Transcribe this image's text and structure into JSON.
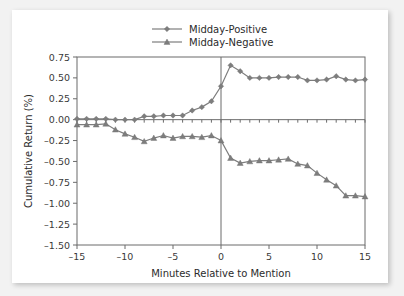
{
  "figure": {
    "background_color": "#f2f2f2",
    "card_color": "#ffffff",
    "line_color": "#7d7d7d",
    "axis_color": "#6b6b6b"
  },
  "chart_data": {
    "type": "line",
    "title": "",
    "xlabel": "Minutes Relative to Mention",
    "ylabel": "Cumulative Return (%)",
    "xlim": [
      -15,
      15
    ],
    "ylim": [
      -1.5,
      0.75
    ],
    "xticks": [
      -15,
      -10,
      -5,
      0,
      5,
      10,
      15
    ],
    "xtick_labels": [
      "–15",
      "–10",
      "–5",
      "0",
      "5",
      "10",
      "15"
    ],
    "yticks": [
      0.75,
      0.5,
      0.25,
      0,
      -0.25,
      -0.5,
      -0.75,
      -1.0,
      -1.25,
      -1.5
    ],
    "ytick_labels": [
      "0.75",
      "0.50",
      "0.25",
      "0.00",
      "–0.25",
      "–0.50",
      "–0.75",
      "–1.00",
      "–1.25",
      "–1.50"
    ],
    "grid": false,
    "legend_position": "top-center",
    "reference_lines": [
      {
        "axis": "x",
        "value": 0
      },
      {
        "axis": "y",
        "value": 0
      }
    ],
    "x": [
      -15,
      -14,
      -13,
      -12,
      -11,
      -10,
      -9,
      -8,
      -7,
      -6,
      -5,
      -4,
      -3,
      -2,
      -1,
      0,
      1,
      2,
      3,
      4,
      5,
      6,
      7,
      8,
      9,
      10,
      11,
      12,
      13,
      14,
      15
    ],
    "series": [
      {
        "name": "Midday-Positive",
        "marker": "diamond",
        "color": "#7d7d7d",
        "values": [
          0.01,
          0.01,
          0.01,
          0.01,
          0.0,
          0.0,
          0.0,
          0.04,
          0.04,
          0.05,
          0.05,
          0.05,
          0.11,
          0.15,
          0.22,
          0.4,
          0.65,
          0.58,
          0.5,
          0.5,
          0.5,
          0.51,
          0.51,
          0.51,
          0.47,
          0.47,
          0.48,
          0.52,
          0.48,
          0.47,
          0.48
        ]
      },
      {
        "name": "Midday-Negative",
        "marker": "triangle",
        "color": "#7d7d7d",
        "values": [
          -0.06,
          -0.06,
          -0.06,
          -0.05,
          -0.12,
          -0.17,
          -0.21,
          -0.26,
          -0.22,
          -0.19,
          -0.22,
          -0.2,
          -0.2,
          -0.21,
          -0.19,
          -0.25,
          -0.46,
          -0.52,
          -0.5,
          -0.49,
          -0.49,
          -0.48,
          -0.47,
          -0.53,
          -0.55,
          -0.64,
          -0.72,
          -0.79,
          -0.91,
          -0.91,
          -0.92
        ]
      }
    ]
  },
  "legend": {
    "entries": [
      {
        "label": "Midday-Positive",
        "marker": "diamond"
      },
      {
        "label": "Midday-Negative",
        "marker": "triangle"
      }
    ]
  }
}
